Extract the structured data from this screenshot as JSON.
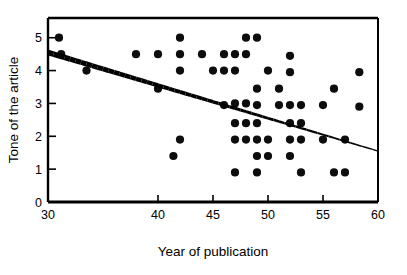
{
  "chart_data": {
    "type": "scatter",
    "title": "",
    "xlabel": "Year of publication",
    "ylabel": "Tone of the article",
    "xlim": [
      30,
      60
    ],
    "ylim": [
      0,
      5.6
    ],
    "xticks": [
      30,
      40,
      45,
      50,
      55,
      60
    ],
    "xtick_labels": [
      "30",
      "40",
      "45",
      "50",
      "55",
      "60"
    ],
    "yticks": [
      0,
      1,
      2,
      3,
      4,
      5
    ],
    "ytick_labels": [
      "0",
      "1",
      "2",
      "3",
      "4",
      "5"
    ],
    "grid": false,
    "legend": false,
    "marker": "filled-circle",
    "marker_color": "#0d0d0d",
    "points": [
      {
        "x": 31.0,
        "y": 5.0
      },
      {
        "x": 31.2,
        "y": 4.5
      },
      {
        "x": 33.5,
        "y": 4.0
      },
      {
        "x": 38.0,
        "y": 4.5
      },
      {
        "x": 40.0,
        "y": 4.5
      },
      {
        "x": 40.0,
        "y": 3.45
      },
      {
        "x": 41.4,
        "y": 1.4
      },
      {
        "x": 42.0,
        "y": 5.0
      },
      {
        "x": 42.0,
        "y": 4.5
      },
      {
        "x": 42.0,
        "y": 4.0
      },
      {
        "x": 42.0,
        "y": 1.9
      },
      {
        "x": 44.0,
        "y": 4.5
      },
      {
        "x": 45.0,
        "y": 4.0
      },
      {
        "x": 46.0,
        "y": 4.5
      },
      {
        "x": 46.0,
        "y": 4.0
      },
      {
        "x": 46.0,
        "y": 2.95
      },
      {
        "x": 47.0,
        "y": 4.5
      },
      {
        "x": 47.0,
        "y": 4.0
      },
      {
        "x": 47.0,
        "y": 3.0
      },
      {
        "x": 47.0,
        "y": 2.4
      },
      {
        "x": 47.0,
        "y": 1.9
      },
      {
        "x": 47.0,
        "y": 0.9
      },
      {
        "x": 48.0,
        "y": 5.0
      },
      {
        "x": 48.0,
        "y": 4.5
      },
      {
        "x": 48.0,
        "y": 3.0
      },
      {
        "x": 48.0,
        "y": 2.4
      },
      {
        "x": 48.0,
        "y": 1.9
      },
      {
        "x": 49.0,
        "y": 5.0
      },
      {
        "x": 49.0,
        "y": 3.45
      },
      {
        "x": 49.0,
        "y": 2.95
      },
      {
        "x": 49.0,
        "y": 2.4
      },
      {
        "x": 49.0,
        "y": 1.9
      },
      {
        "x": 49.0,
        "y": 1.4
      },
      {
        "x": 49.0,
        "y": 0.9
      },
      {
        "x": 50.0,
        "y": 4.0
      },
      {
        "x": 50.0,
        "y": 1.9
      },
      {
        "x": 50.0,
        "y": 1.4
      },
      {
        "x": 51.0,
        "y": 3.45
      },
      {
        "x": 51.0,
        "y": 2.95
      },
      {
        "x": 52.0,
        "y": 4.45
      },
      {
        "x": 52.0,
        "y": 3.95
      },
      {
        "x": 52.0,
        "y": 2.95
      },
      {
        "x": 52.0,
        "y": 2.4
      },
      {
        "x": 52.0,
        "y": 1.9
      },
      {
        "x": 52.0,
        "y": 1.4
      },
      {
        "x": 53.0,
        "y": 2.95
      },
      {
        "x": 53.0,
        "y": 2.4
      },
      {
        "x": 53.0,
        "y": 1.9
      },
      {
        "x": 53.0,
        "y": 0.9
      },
      {
        "x": 55.0,
        "y": 2.95
      },
      {
        "x": 55.0,
        "y": 1.9
      },
      {
        "x": 56.0,
        "y": 3.45
      },
      {
        "x": 56.0,
        "y": 0.9
      },
      {
        "x": 57.0,
        "y": 1.9
      },
      {
        "x": 57.0,
        "y": 0.9
      },
      {
        "x": 58.3,
        "y": 3.95
      },
      {
        "x": 58.3,
        "y": 2.9
      }
    ],
    "fit_line": {
      "type": "linear-regression",
      "x_start": 30.0,
      "y_start": 4.55,
      "x_end": 60.0,
      "y_end": 1.55,
      "color": "#000000"
    }
  }
}
